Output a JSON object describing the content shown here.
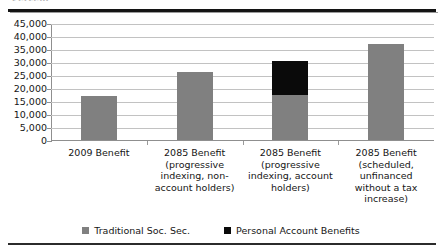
{
  "figure": {
    "clipped_header_fragment": "Percent",
    "background_color": "#ffffff"
  },
  "legend": {
    "position": "bottom-center",
    "entries": [
      {
        "label": "Traditional Soc. Sec.",
        "color": "#808080",
        "swatch_name": "legend-swatch-traditional"
      },
      {
        "label": "Personal Account Benefits",
        "color": "#0a0a0a",
        "swatch_name": "legend-swatch-personal-account"
      }
    ]
  },
  "chart_data": {
    "type": "bar",
    "stacked": true,
    "title": "",
    "xlabel": "",
    "ylabel": "",
    "ylim": [
      0,
      45000
    ],
    "ytick_step": 5000,
    "grid": true,
    "ytick_labels": [
      "45,000",
      "40,000",
      "35,000",
      "30,000",
      "25,000",
      "20,000",
      "15,000",
      "10,000",
      "5,000",
      "0"
    ],
    "ytick_values": [
      45000,
      40000,
      35000,
      30000,
      25000,
      20000,
      15000,
      10000,
      5000,
      0
    ],
    "categories": [
      "2009 Benefit",
      "2085 Benefit (progressive indexing, non-account holders)",
      "2085 Benefit (progressive indexing, account holders)",
      "2085 Benefit (scheduled, unfinanced without a tax increase)"
    ],
    "category_lines": [
      [
        "2009 Benefit"
      ],
      [
        "2085 Benefit",
        "(progressive",
        "indexing, non-",
        "account holders)"
      ],
      [
        "2085 Benefit",
        "(progressive",
        "indexing, account",
        "holders)"
      ],
      [
        "2085 Benefit",
        "(scheduled,",
        "unfinanced",
        "without a tax",
        "increase)"
      ]
    ],
    "series": [
      {
        "name": "Traditional Soc. Sec.",
        "color": "#808080",
        "values": [
          17000,
          26000,
          17500,
          37000
        ]
      },
      {
        "name": "Personal Account Benefits",
        "color": "#0a0a0a",
        "values": [
          0,
          0,
          13000,
          0
        ]
      }
    ],
    "totals": [
      17000,
      26000,
      30500,
      37000
    ]
  }
}
